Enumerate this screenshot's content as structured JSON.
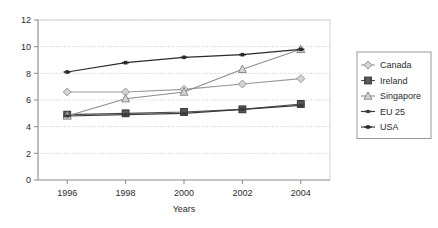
{
  "chart_data": {
    "type": "line",
    "title": "",
    "xlabel": "Years",
    "ylabel": "",
    "x": [
      1996,
      1998,
      2000,
      2002,
      2004
    ],
    "xtick_labels": [
      "1996",
      "1998",
      "2000",
      "2002",
      "2004"
    ],
    "ytick_labels": [
      "0",
      "2",
      "4",
      "6",
      "8",
      "10",
      "12"
    ],
    "ytick_values": [
      0,
      2,
      4,
      6,
      8,
      10,
      12
    ],
    "ylim": [
      0,
      12
    ],
    "xlim": [
      1995,
      2005
    ],
    "grid": "horizontal-dotted",
    "legend_position": "right-outside",
    "series": [
      {
        "name": "Canada",
        "marker": "diamond-open",
        "color": "#9a9a9a",
        "values": [
          6.6,
          6.6,
          6.8,
          7.2,
          7.6
        ]
      },
      {
        "name": "Ireland",
        "marker": "square-filled",
        "color": "#4d4d4d",
        "values": [
          4.9,
          5.0,
          5.1,
          5.3,
          5.7
        ]
      },
      {
        "name": "Singapore",
        "marker": "triangle-open",
        "color": "#8c8c8c",
        "values": [
          4.8,
          6.1,
          6.6,
          8.3,
          9.8
        ]
      },
      {
        "name": "EU 25",
        "marker": "cross-small",
        "color": "#3a3a3a",
        "values": [
          4.8,
          4.9,
          5.0,
          5.3,
          5.6
        ]
      },
      {
        "name": "USA",
        "marker": "plus-filled",
        "color": "#2a2a2a",
        "values": [
          8.1,
          8.8,
          9.2,
          9.4,
          9.8
        ]
      }
    ]
  },
  "legend": {
    "entries": [
      {
        "label": "Canada"
      },
      {
        "label": "Ireland"
      },
      {
        "label": "Singapore"
      },
      {
        "label": "EU 25"
      },
      {
        "label": "USA"
      }
    ]
  }
}
